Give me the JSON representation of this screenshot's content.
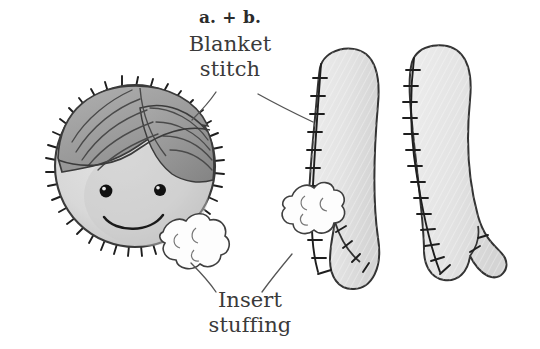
{
  "page": {
    "background_color": "#ffffff",
    "width": 540,
    "height": 349,
    "kind": "sewing-instruction-illustration"
  },
  "labels": {
    "title": "a. + b.",
    "blanket_stitch": "Blanket\nstitch",
    "blanket_stitch_line1": "Blanket",
    "blanket_stitch_line2": "stitch",
    "insert_stuffing": "Insert\nstuffing",
    "insert_stuffing_line1": "Insert",
    "insert_stuffing_line2": "stuffing"
  },
  "colors": {
    "ink": "#2b2b2b",
    "text": "#3a3a3a",
    "outline": "#333333",
    "face_fill": "#d9d9d9",
    "face_shadow": "#c4c4c4",
    "hair_fill": "#a6a6a6",
    "hair_dark": "#8f8f8f",
    "hair_strand": "#4a4a4a",
    "limb_fill": "#e6e6e6",
    "limb_shade": "#d2d2d2",
    "stuffing_fill": "#fdfdfd",
    "stuffing_outline": "#444444",
    "eye": "#111111",
    "eye_highlight": "#ffffff",
    "leader_line": "#555555"
  },
  "figures": [
    {
      "name": "doll-head",
      "description": "Round felt head with side-parted hair, two eyes, a smile, blanket stitch around the perimeter, and a puff of stuffing at the lower right.",
      "parts": [
        "head-circle",
        "hair",
        "left-eye",
        "right-eye",
        "smile",
        "blanket-stitch-edge",
        "stuffing-puff"
      ],
      "stitch_count": 34
    },
    {
      "name": "doll-limb-left",
      "description": "Elongated felt limb with rounded top, notched foot at the bottom, blanket stitch along the left edge, and a puff of stuffing at the opening.",
      "parts": [
        "limb-body",
        "blanket-stitch-edge",
        "stuffing-puff",
        "foot-notch"
      ],
      "stitch_count": 13
    },
    {
      "name": "doll-limb-right",
      "description": "Elongated felt limb with rounded top, notched foot at the bottom, and blanket stitch running the full left edge.",
      "parts": [
        "limb-body",
        "blanket-stitch-edge",
        "foot-notch"
      ],
      "stitch_count": 16
    }
  ],
  "callouts": [
    {
      "name": "blanket-stitch-callout",
      "label": "Blanket stitch",
      "targets": [
        "doll-head-edge",
        "doll-limb-left-edge"
      ],
      "leader_lines": 2
    },
    {
      "name": "insert-stuffing-callout",
      "label": "Insert stuffing",
      "targets": [
        "head-stuffing-puff",
        "limb-stuffing-puff"
      ],
      "leader_lines": 2
    }
  ]
}
